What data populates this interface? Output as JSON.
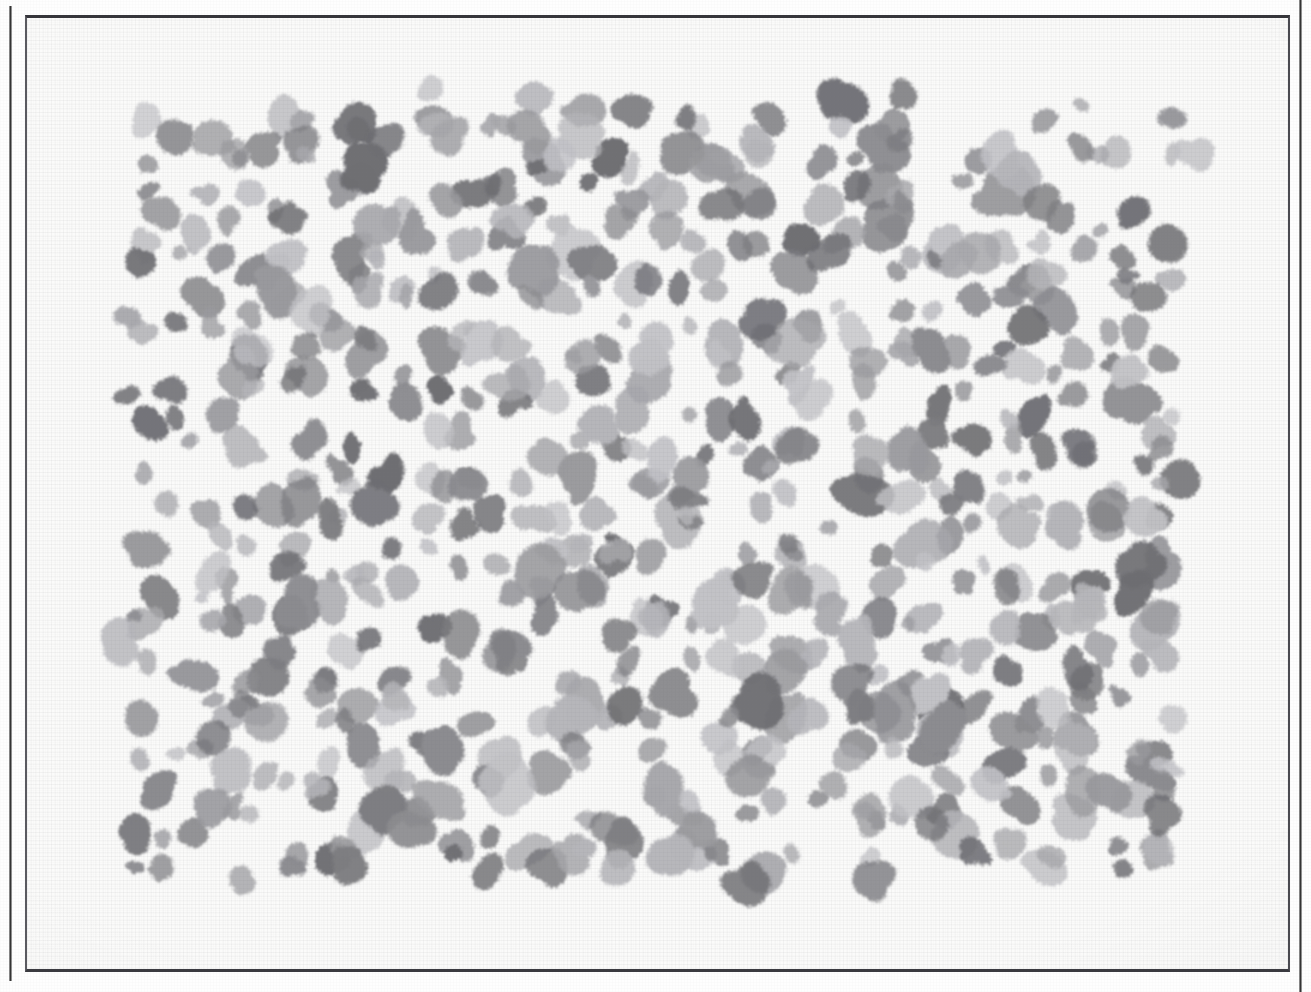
{
  "page": {
    "kind": "scanned-figure-plate",
    "width": 1311,
    "height": 992,
    "paper_color": "#fbfbfa",
    "outer_background": "#fefefe"
  },
  "frame": {
    "border_color": "#35353a",
    "left": 25,
    "top": 15,
    "width": 1265,
    "height": 957
  },
  "gutter_rules": [
    {
      "name": "left-scan-rule",
      "x": 9,
      "color": "#2e2e2e"
    },
    {
      "name": "right-scan-rule",
      "x": 1299,
      "color": "#3a3a3a"
    }
  ],
  "chart_data": {
    "type": "scatter",
    "title": "",
    "subtitle": "",
    "xlabel": "",
    "ylabel": "",
    "legend": [],
    "grid": false,
    "field_bounds": {
      "x0": 110,
      "y0": 88,
      "x1": 1198,
      "y1": 893
    },
    "xlim": [
      110,
      1198
    ],
    "ylim": [
      88,
      893
    ],
    "marker": {
      "shape": "irregular-blob",
      "size_px_range": [
        16,
        46
      ],
      "gray_levels": [
        "#6e6e72",
        "#7d7d81",
        "#8c8c90",
        "#9a9a9e",
        "#a8a8ac",
        "#b6b6ba",
        "#c2c2c6"
      ]
    },
    "point_count": 690,
    "seed": 20240417,
    "jitter": {
      "cell_w": 36,
      "cell_h": 33,
      "amount": 0.62
    }
  }
}
